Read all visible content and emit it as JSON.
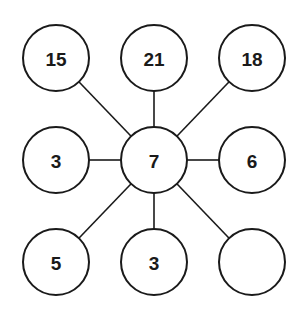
{
  "diagram": {
    "type": "number-puzzle-star",
    "center": {
      "id": "center",
      "value": "7",
      "x": 154,
      "y": 160
    },
    "outer_nodes": [
      {
        "id": "top-left",
        "value": "15",
        "x": 56,
        "y": 58
      },
      {
        "id": "top-middle",
        "value": "21",
        "x": 154,
        "y": 58
      },
      {
        "id": "top-right",
        "value": "18",
        "x": 252,
        "y": 58
      },
      {
        "id": "middle-left",
        "value": "3",
        "x": 56,
        "y": 160
      },
      {
        "id": "middle-right",
        "value": "6",
        "x": 252,
        "y": 160
      },
      {
        "id": "bottom-left",
        "value": "5",
        "x": 56,
        "y": 262
      },
      {
        "id": "bottom-middle",
        "value": "3",
        "x": 154,
        "y": 262
      },
      {
        "id": "bottom-right",
        "value": "",
        "x": 252,
        "y": 262
      }
    ],
    "node_radius": 33,
    "colors": {
      "stroke": "#1a1a1a",
      "fill": "#ffffff",
      "background": "#ffffff"
    }
  }
}
